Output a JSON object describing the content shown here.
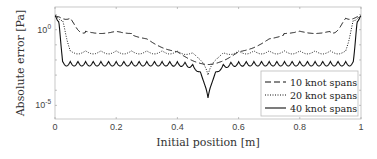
{
  "chart_data": {
    "type": "line",
    "title": "",
    "xlabel": "Initial position [m]",
    "ylabel": "Absolute error [Pa]",
    "xlim": [
      0,
      1
    ],
    "ylim_log10": [
      -5.9,
      1.5
    ],
    "yscale": "log",
    "grid": false,
    "x_ticks": [
      "0",
      "0.2",
      "0.4",
      "0.6",
      "0.8",
      "1"
    ],
    "y_ticks": [
      {
        "label": "10",
        "exp": "0",
        "value": 1
      },
      {
        "label": "10",
        "exp": "-5",
        "value": 1e-05
      }
    ],
    "legend_position": "lower right",
    "series": [
      {
        "name": "10 knot spans",
        "style": "dashed",
        "edge_start": 0.1,
        "plateau_log10": -0.2,
        "center_log10": -2.3,
        "ripple": 0.15
      },
      {
        "name": "20 knot spans",
        "style": "dotted",
        "edge_start": 0.05,
        "plateau_log10": -1.4,
        "center_log10": -3.0,
        "ripple": 0.2
      },
      {
        "name": "40 knot spans",
        "style": "solid",
        "edge_start": 0.025,
        "plateau_log10": -2.1,
        "center_log10": -4.5,
        "ripple": 0.3
      }
    ]
  }
}
